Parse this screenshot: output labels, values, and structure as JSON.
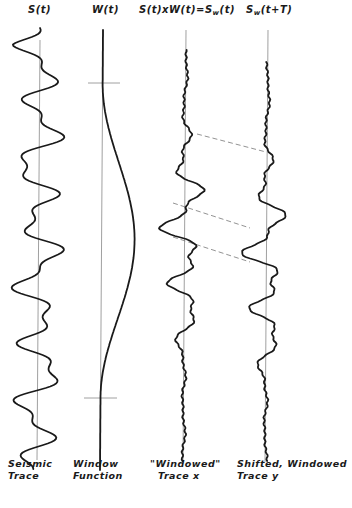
{
  "figure": {
    "headers": [
      {
        "id": "s",
        "main": "S(t)",
        "sub": "",
        "tail": ""
      },
      {
        "id": "w",
        "main": "W(t)",
        "sub": "",
        "tail": ""
      },
      {
        "id": "sw",
        "main": "S(t)xW(t)=S",
        "sub": "w",
        "tail": "(t)"
      },
      {
        "id": "swt",
        "main": "S",
        "sub": "w",
        "tail": "(t+T)"
      }
    ],
    "captions": [
      {
        "line1": "Seismic",
        "line2": "Trace"
      },
      {
        "line1": "Window",
        "line2": "Function"
      },
      {
        "line1": "\"Windowed\"",
        "line2": "Trace x"
      },
      {
        "line1": "Shifted, Windowed",
        "line2": "Trace y"
      }
    ],
    "colors": {
      "ink": "#1a1a1a",
      "axis": "#888888",
      "dash": "#777777"
    }
  }
}
